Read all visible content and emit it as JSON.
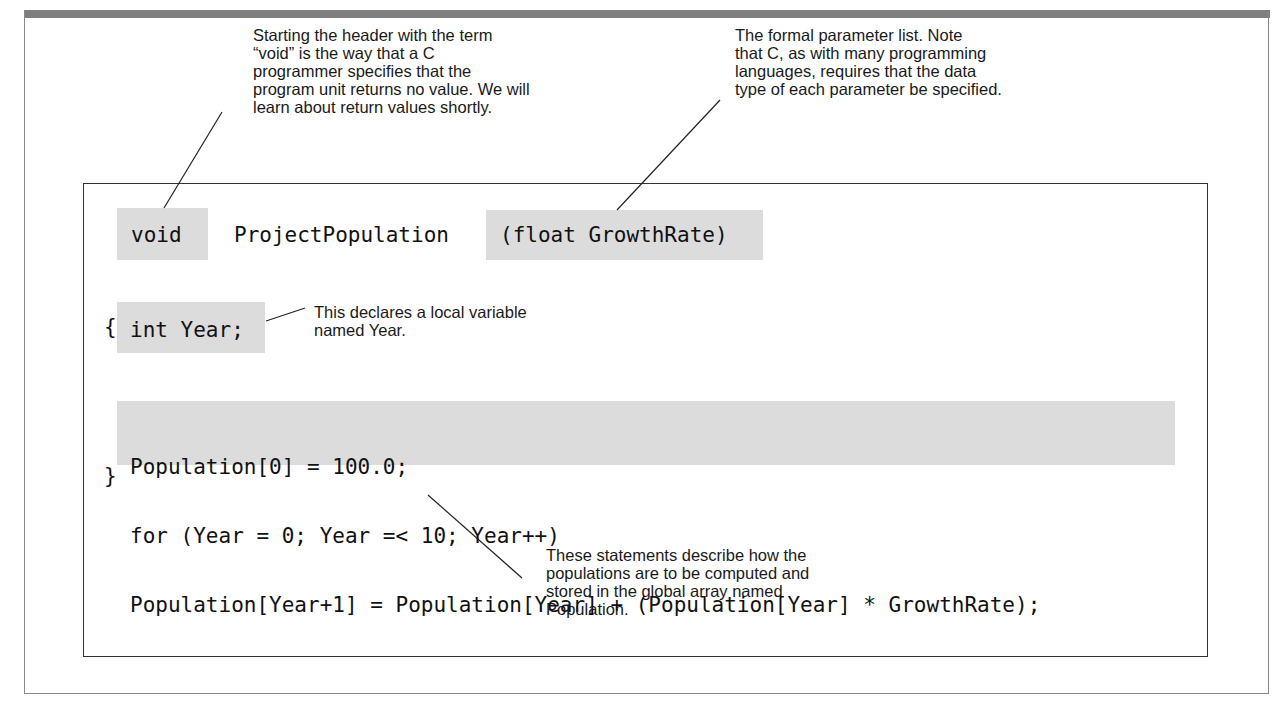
{
  "annotations": {
    "void_note": [
      "Starting the header with the term",
      "“void” is the way that a C",
      "programmer specifies that the",
      "program unit returns no value. We will",
      "learn about return values shortly."
    ],
    "param_note": [
      "The formal parameter list. Note",
      "that C, as with many programming",
      "languages, requires that the data",
      "type of each parameter be specified."
    ],
    "local_var_note": [
      "This declares a local variable",
      "named Year."
    ],
    "statements_note": [
      "These statements describe how the",
      "populations are to be computed and",
      "stored in the global array named",
      "Population."
    ]
  },
  "code": {
    "return_type": "void",
    "function_name": "ProjectPopulation",
    "parameters": "(float GrowthRate)",
    "open_brace": "{",
    "declaration": "int Year;",
    "body_lines": [
      "Population[0] = 100.0;",
      "for (Year = 0; Year =< 10; Year++)",
      "Population[Year+1] = Population[Year] + (Population[Year] * GrowthRate);"
    ],
    "close_brace": "}"
  },
  "colors": {
    "highlight": "#dcdcdc",
    "top_bar": "#7f7f7f",
    "border": "#333333"
  }
}
